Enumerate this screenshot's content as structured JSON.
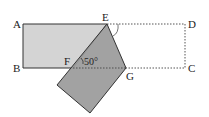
{
  "diagram": {
    "type": "geometry-fold",
    "colors": {
      "light_fill": "#d4d4d4",
      "dark_fill": "#9a9a9a",
      "stroke": "#333333",
      "dotted": "#555555",
      "background": "#ffffff"
    },
    "points": {
      "A": {
        "label": "A",
        "x": 23,
        "y": 24
      },
      "B": {
        "label": "B",
        "x": 23,
        "y": 68
      },
      "C": {
        "label": "C",
        "x": 185,
        "y": 68
      },
      "D": {
        "label": "D",
        "x": 185,
        "y": 24
      },
      "E": {
        "label": "E",
        "x": 107,
        "y": 24
      },
      "F": {
        "label": "F",
        "x": 73,
        "y": 68
      },
      "G": {
        "label": "G",
        "x": 126,
        "y": 68
      },
      "P": {
        "x": 57,
        "y": 85
      },
      "Q": {
        "x": 90,
        "y": 113
      }
    },
    "angle_label": "50°",
    "labels": {
      "A": "A",
      "B": "B",
      "C": "C",
      "D": "D",
      "E": "E",
      "F": "F",
      "G": "G"
    }
  }
}
